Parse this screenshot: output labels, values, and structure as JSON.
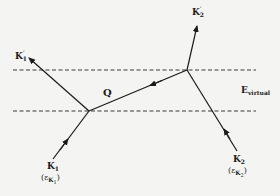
{
  "diagram": {
    "type": "scattering-diagram",
    "colors": {
      "line": "#1a1a1a",
      "dashed": "#3a3a3a",
      "background": "#f4f4f2"
    },
    "boundary_label": {
      "main": "E",
      "sub": "virtual"
    },
    "exchange_label": "Q",
    "particles": {
      "k1": {
        "main": "K",
        "sub": "1",
        "energy_open": "(",
        "energy_main": "ε",
        "energy_sub": "K",
        "energy_subsub": "1",
        "energy_close": ")"
      },
      "k2": {
        "main": "K",
        "sub": "2",
        "energy_open": "(",
        "energy_main": "ε",
        "energy_sub": "K",
        "energy_subsub": "2",
        "energy_close": ")"
      },
      "k1_prime": {
        "main": "K",
        "prime": "′",
        "sub": "1"
      },
      "k2_prime": {
        "main": "K",
        "prime": "′",
        "sub": "2"
      }
    },
    "vertices": [
      {
        "name": "left-vertex",
        "x": 89,
        "y": 111
      },
      {
        "name": "right-vertex",
        "x": 187,
        "y": 70
      }
    ],
    "edges": [
      {
        "from": "K1",
        "to": "left-vertex",
        "direction": "incoming"
      },
      {
        "from": "left-vertex",
        "to": "K1'",
        "direction": "outgoing"
      },
      {
        "from": "K2",
        "to": "right-vertex",
        "direction": "incoming"
      },
      {
        "from": "right-vertex",
        "to": "K2'",
        "direction": "outgoing"
      },
      {
        "from": "right-vertex",
        "to": "left-vertex",
        "label": "Q",
        "direction": "exchange"
      }
    ]
  }
}
